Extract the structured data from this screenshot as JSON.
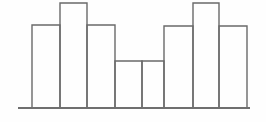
{
  "figure": {
    "name": "histogram-outline",
    "width": 266,
    "height": 122,
    "background_color": "#fefefe",
    "line_color": "#6a6a6a",
    "baseline_color": "#6f6f6f",
    "line_width": 1.4,
    "baseline_width": 2.0
  },
  "chart_data": {
    "type": "bar",
    "title": "",
    "subtitle": "",
    "xlabel": "",
    "ylabel": "",
    "categories": [
      "1",
      "2",
      "3",
      "4",
      "5",
      "6",
      "7",
      "8"
    ],
    "values": [
      83,
      105,
      83,
      47,
      47,
      82,
      105,
      82
    ],
    "ylim": [
      0,
      108
    ],
    "xlim": [
      18,
      250
    ],
    "grid": false,
    "legend": null,
    "legend_position": "none",
    "tick_labels_x": [],
    "tick_labels_y": [],
    "annotations": [],
    "style": "outline-only bars, no fill, shared edges, drawn on a single horizontal baseline",
    "bar_edges_px": [
      32,
      60,
      87,
      115,
      142,
      164,
      193,
      219,
      247
    ],
    "bar_tops_px": [
      25,
      3,
      25,
      61,
      61,
      26,
      3,
      26
    ],
    "baseline_y_px": 108,
    "baseline_x_start_px": 18,
    "baseline_x_end_px": 250
  }
}
